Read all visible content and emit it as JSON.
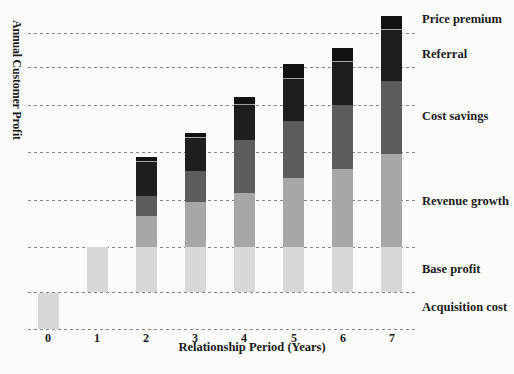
{
  "figure": {
    "title": "",
    "ylabel": "Annual Customer Profit",
    "xlabel": "Relationship Period (Years)"
  },
  "chart_data": {
    "type": "bar",
    "stacked": true,
    "title": "",
    "xlabel": "Relationship Period (Years)",
    "ylabel": "Annual Customer Profit",
    "x": [
      0,
      1,
      2,
      3,
      4,
      5,
      6,
      7
    ],
    "x_ticks": [
      "0",
      "1",
      "2",
      "3",
      "4",
      "5",
      "6",
      "7"
    ],
    "y_axis": {
      "numeric_tick_labels_shown": false,
      "units": "relative profit units (one dashed gridline spacing = 1 unit)",
      "gridlines_at": [
        -1,
        0,
        1,
        2,
        3,
        4,
        5,
        6
      ],
      "grid_style": "dashed",
      "baseline_value": 0
    },
    "series": [
      {
        "name": "Acquisition cost",
        "color": "#d8d8d8",
        "values": [
          -1,
          0,
          0,
          0,
          0,
          0,
          0,
          0
        ]
      },
      {
        "name": "Base profit",
        "color": "#d8d8d8",
        "values": [
          0,
          1,
          1,
          1,
          1,
          1,
          1,
          1
        ]
      },
      {
        "name": "Revenue growth",
        "color": "#a7a7a7",
        "values": [
          0,
          0,
          0.65,
          0.95,
          1.15,
          1.45,
          1.65,
          1.95
        ]
      },
      {
        "name": "Cost savings",
        "color": "#5c5c5c",
        "values": [
          0,
          0,
          0.45,
          0.65,
          1.1,
          1.2,
          1.35,
          1.7
        ]
      },
      {
        "name": "Referral",
        "color": "#1e1e1e",
        "values": [
          0,
          0,
          0.7,
          0.7,
          0.75,
          1.05,
          1.15,
          1.45
        ]
      },
      {
        "name": "Price premium",
        "color": "#121212",
        "values": [
          0,
          0,
          0.1,
          0.1,
          0.2,
          0.4,
          0.4,
          0.4
        ]
      }
    ],
    "band_labels": [
      "Price premium",
      "Referral",
      "Cost savings",
      "Revenue growth",
      "Base profit",
      "Acquisition cost"
    ],
    "legend_position": "right-band-labels",
    "gridline_color": "#878787",
    "text_color": "#1b1b1b"
  }
}
